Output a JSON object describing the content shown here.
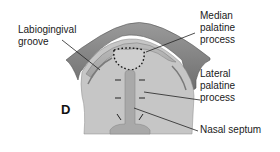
{
  "figure": {
    "panel_letter": "D",
    "labels": {
      "labiogingival": "Labiogingival\ngroove",
      "median": "Median\npalatine\nprocess",
      "lateral": "Lateral\npalatine\nprocess",
      "septum": "Nasal septum"
    },
    "colors": {
      "outer_band": "#8a8a8a",
      "inner_band": "#b5b5b5",
      "palate": "#c4c4c4",
      "septum": "#a8a8a8",
      "leader_line": "#222222"
    }
  }
}
